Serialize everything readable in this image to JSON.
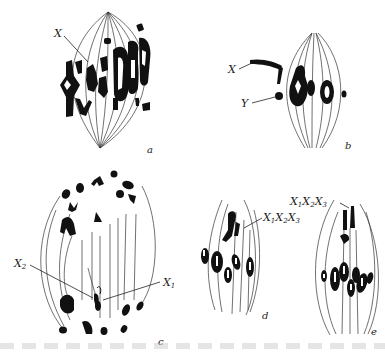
{
  "figure": {
    "type": "cytology diagram",
    "panels": [
      {
        "id": "a",
        "label": "a",
        "annotations": [
          {
            "text": "X",
            "target": "X chromosome in metaphase plate"
          }
        ]
      },
      {
        "id": "b",
        "label": "b",
        "annotations": [
          {
            "text": "X",
            "target": "X chromosome"
          },
          {
            "text": "Y",
            "target": "Y chromosome"
          }
        ]
      },
      {
        "id": "c",
        "label": "c",
        "annotations": [
          {
            "text": "X2",
            "base": "X",
            "sub": "2"
          },
          {
            "text": "X1",
            "base": "X",
            "sub": "1"
          }
        ]
      },
      {
        "id": "d",
        "label": "d",
        "annotations": [
          {
            "text": "X1X2X3",
            "parts": [
              "X",
              "1",
              "X",
              "2",
              "X",
              "3"
            ]
          }
        ]
      },
      {
        "id": "e",
        "label": "e",
        "annotations": [
          {
            "text": "X1X2X3",
            "parts": [
              "X",
              "1",
              "X",
              "2",
              "X",
              "3"
            ]
          }
        ]
      }
    ]
  },
  "labels": {
    "a_x": "X",
    "b_x": "X",
    "b_y": "Y",
    "c_x": "X",
    "c_sub2": "2",
    "c_x1": "X",
    "c_sub1": "1",
    "d_x1": "X",
    "d_s1": "1",
    "d_x2": "X",
    "d_s2": "2",
    "d_x3": "X",
    "d_s3": "3",
    "e_x1": "X",
    "e_s1": "1",
    "e_x2": "X",
    "e_s2": "2",
    "e_x3": "X",
    "e_s3": "3",
    "panel_a": "a",
    "panel_b": "b",
    "panel_c": "c",
    "panel_d": "d",
    "panel_e": "e"
  },
  "colors": {
    "ink": "#111111",
    "spindle": "#333333",
    "background": "#ffffff"
  }
}
